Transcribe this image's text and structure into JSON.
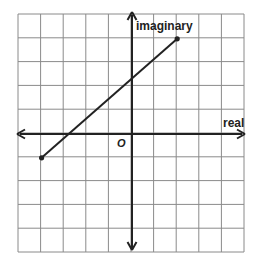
{
  "diagram": {
    "type": "complex-plane",
    "grid": {
      "columns": 10,
      "rows": 10,
      "x_range": [
        -5,
        5
      ],
      "y_range": [
        -5,
        5
      ],
      "cell_px_x": 22.6,
      "cell_px_y": 23.8,
      "origin_px": [
        132,
        134
      ],
      "left_px": 18,
      "top_px": 14,
      "right_px": 244,
      "bottom_px": 252,
      "grid_color": "#8a8a8a",
      "axis_color": "#222222"
    },
    "axes": {
      "x_label": "real",
      "y_label": "imaginary",
      "origin_label": "O"
    },
    "segment": {
      "start": {
        "re": -4,
        "im": -1
      },
      "end": {
        "re": 2,
        "im": 4
      },
      "color": "#222222"
    }
  }
}
